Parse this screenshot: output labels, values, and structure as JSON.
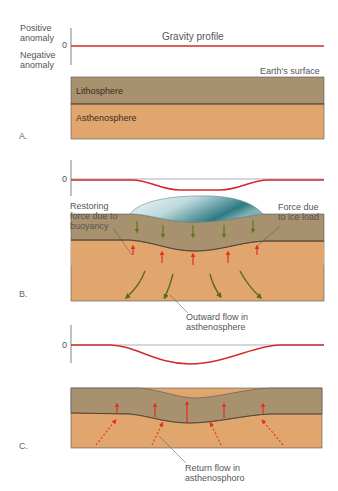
{
  "colors": {
    "gravity_line": "#d42a2a",
    "zero_line": "#8a8aa0",
    "lithosphere": "#a8916e",
    "asthenosphere": "#e0a66e",
    "boundary": "#4a3a2a",
    "ice_light": "#e8f2f4",
    "ice_dark": "#2e7a82",
    "force_ice": "#5a7a1a",
    "force_buoyancy": "#e03020",
    "outward_flow": "#5a6a1a",
    "return_flow": "#e04020"
  },
  "panel_a": {
    "label": "A.",
    "axis_positive": "Positive\nanomaly",
    "axis_negative": "Negative\nanomaly",
    "axis_zero": "0",
    "profile_title": "Gravity profile",
    "surface_label": "Earth's surface",
    "lithosphere_label": "Lithosphere",
    "asthenosphere_label": "Asthenosphere"
  },
  "panel_b": {
    "label": "B.",
    "axis_zero": "0",
    "buoyancy_label": "Restoring\nforce due to\nbuoyancy",
    "ice_load_label": "Force due\nto ice load",
    "flow_label": "Outward flow in\nasthenosphere"
  },
  "panel_c": {
    "label": "C.",
    "axis_zero": "0",
    "flow_label": "Return flow in\nasthenosphoro"
  }
}
